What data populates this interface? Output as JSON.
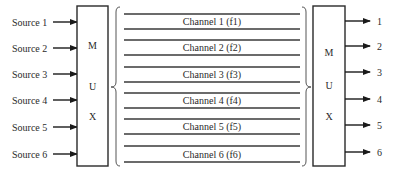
{
  "diagram": {
    "sources": [
      {
        "label": "Source 1",
        "y": 22
      },
      {
        "label": "Source 2",
        "y": 48
      },
      {
        "label": "Source 3",
        "y": 74
      },
      {
        "label": "Source 4",
        "y": 100
      },
      {
        "label": "Source 5",
        "y": 127
      },
      {
        "label": "Source 6",
        "y": 154
      }
    ],
    "mux_left": {
      "letters": [
        "M",
        "U",
        "X"
      ]
    },
    "mux_right": {
      "letters": [
        "M",
        "U",
        "X"
      ]
    },
    "channels": [
      {
        "label": "Channel 1 (f1)",
        "top": 14,
        "bottom": 29
      },
      {
        "label": "Channel 2 (f2)",
        "top": 40,
        "bottom": 55
      },
      {
        "label": "Channel 3 (f3)",
        "top": 67,
        "bottom": 82
      },
      {
        "label": "Channel 4 (f4)",
        "top": 93,
        "bottom": 108
      },
      {
        "label": "Channel 5 (f5)",
        "top": 119,
        "bottom": 134
      },
      {
        "label": "Channel 6 (f6)",
        "top": 146,
        "bottom": 162
      }
    ],
    "outputs": [
      {
        "label": "1",
        "y": 21
      },
      {
        "label": "2",
        "y": 46
      },
      {
        "label": "3",
        "y": 72
      },
      {
        "label": "4",
        "y": 99
      },
      {
        "label": "5",
        "y": 125
      },
      {
        "label": "6",
        "y": 152
      }
    ]
  }
}
